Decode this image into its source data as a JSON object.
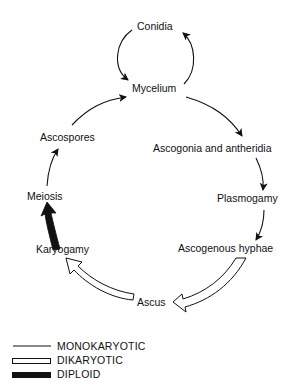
{
  "diagram": {
    "title": "",
    "nodes": [
      {
        "id": "conidia",
        "label": "Conidia"
      },
      {
        "id": "mycelium",
        "label": "Mycelium"
      },
      {
        "id": "ascogonia",
        "label": "Ascogonia and antheridia"
      },
      {
        "id": "plasmogamy",
        "label": "Plasmogamy"
      },
      {
        "id": "ascogenous",
        "label": "Ascogenous hyphae"
      },
      {
        "id": "ascus",
        "label": "Ascus"
      },
      {
        "id": "karyogamy",
        "label": "Karyogamy"
      },
      {
        "id": "meiosis",
        "label": "Meiosis"
      },
      {
        "id": "ascospores",
        "label": "Ascospores"
      }
    ],
    "edges": [
      {
        "from": "Mycelium",
        "to": "Conidia",
        "phase": "monokaryotic"
      },
      {
        "from": "Conidia",
        "to": "Mycelium",
        "phase": "monokaryotic"
      },
      {
        "from": "Mycelium",
        "to": "Ascogonia and antheridia",
        "phase": "monokaryotic"
      },
      {
        "from": "Ascogonia and antheridia",
        "to": "Plasmogamy",
        "phase": "monokaryotic"
      },
      {
        "from": "Plasmogamy",
        "to": "Ascogenous hyphae",
        "phase": "monokaryotic"
      },
      {
        "from": "Ascogenous hyphae",
        "to": "Ascus",
        "phase": "dikaryotic"
      },
      {
        "from": "Ascus",
        "to": "Karyogamy",
        "phase": "dikaryotic"
      },
      {
        "from": "Karyogamy",
        "to": "Meiosis",
        "phase": "diploid"
      },
      {
        "from": "Meiosis",
        "to": "Ascospores",
        "phase": "monokaryotic"
      },
      {
        "from": "Ascospores",
        "to": "Mycelium",
        "phase": "monokaryotic"
      }
    ]
  },
  "legend": {
    "items": [
      {
        "style": "thin-line",
        "label": "MONOKARYOTIC"
      },
      {
        "style": "hollow-bar",
        "label": "DIKARYOTIC"
      },
      {
        "style": "solid-bar",
        "label": "DIPLOID"
      }
    ]
  },
  "colors": {
    "ink": "#111111",
    "background": "#ffffff"
  }
}
